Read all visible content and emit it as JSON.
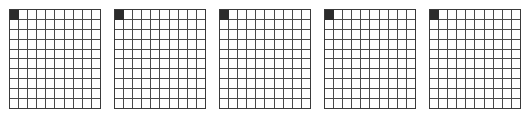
{
  "canvas": {
    "width": 531,
    "height": 118,
    "background_color": "#ffffff"
  },
  "style": {
    "grid_line_color": "#4a4a4a",
    "grid_outline_color": "#3a3a3a",
    "filled_cell_color": "#2b2b2b",
    "empty_cell_color": "#ffffff"
  },
  "layout": {
    "panel_count": 5,
    "panel_width": 92,
    "panel_height": 100,
    "panel_gap": 13,
    "left_offset": 9,
    "top_offset": 9
  },
  "grids": [
    {
      "name": "grid-1",
      "rows": 10,
      "cols": 10,
      "filled_cells": [
        [
          0,
          0
        ]
      ],
      "filled_count": 1
    },
    {
      "name": "grid-2",
      "rows": 10,
      "cols": 10,
      "filled_cells": [
        [
          0,
          0
        ]
      ],
      "filled_count": 1
    },
    {
      "name": "grid-3",
      "rows": 10,
      "cols": 10,
      "filled_cells": [
        [
          0,
          0
        ]
      ],
      "filled_count": 1
    },
    {
      "name": "grid-4",
      "rows": 10,
      "cols": 10,
      "filled_cells": [
        [
          0,
          0
        ]
      ],
      "filled_count": 1
    },
    {
      "name": "grid-5",
      "rows": 10,
      "cols": 10,
      "filled_cells": [
        [
          0,
          0
        ]
      ],
      "filled_count": 1
    }
  ]
}
